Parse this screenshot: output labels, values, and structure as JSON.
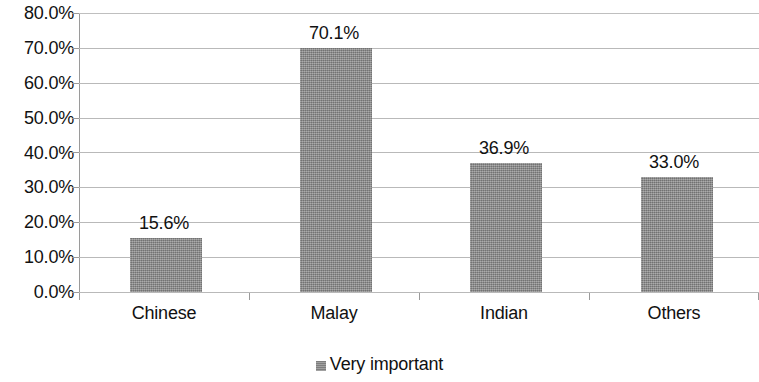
{
  "chart_data": {
    "type": "bar",
    "title": "",
    "subtitle": "",
    "xlabel": "",
    "ylabel": "",
    "categories": [
      "Chinese",
      "Malay",
      "Indian",
      "Others"
    ],
    "series": [
      {
        "name": "Very important",
        "values": [
          15.6,
          70.1,
          36.9,
          33.0
        ],
        "value_labels": [
          "15.6%",
          "70.1%",
          "36.9%",
          "33.0%"
        ],
        "color": "#8c8c8c"
      }
    ],
    "ylim": [
      0,
      80
    ],
    "ytick_values": [
      0,
      10,
      20,
      30,
      40,
      50,
      60,
      70,
      80
    ],
    "ytick_labels": [
      "0.0%",
      "10.0%",
      "20.0%",
      "30.0%",
      "40.0%",
      "50.0%",
      "60.0%",
      "70.0%",
      "80.0%"
    ],
    "grid": "horizontal",
    "legend_position": "bottom",
    "legend_entries": [
      "Very important"
    ],
    "annotations": []
  },
  "axes": {
    "y": {
      "ticks": [
        {
          "label": "80.0%",
          "value": 80
        },
        {
          "label": "70.0%",
          "value": 70
        },
        {
          "label": "60.0%",
          "value": 60
        },
        {
          "label": "50.0%",
          "value": 50
        },
        {
          "label": "40.0%",
          "value": 40
        },
        {
          "label": "30.0%",
          "value": 30
        },
        {
          "label": "20.0%",
          "value": 20
        },
        {
          "label": "10.0%",
          "value": 10
        },
        {
          "label": "0.0%",
          "value": 0
        }
      ]
    },
    "x": {
      "ticks": [
        {
          "label": "Chinese"
        },
        {
          "label": "Malay"
        },
        {
          "label": "Indian"
        },
        {
          "label": "Others"
        }
      ]
    }
  },
  "legend": {
    "items": [
      {
        "label": "Very important",
        "color": "#8c8c8c",
        "marker": "square-swatch"
      }
    ]
  }
}
